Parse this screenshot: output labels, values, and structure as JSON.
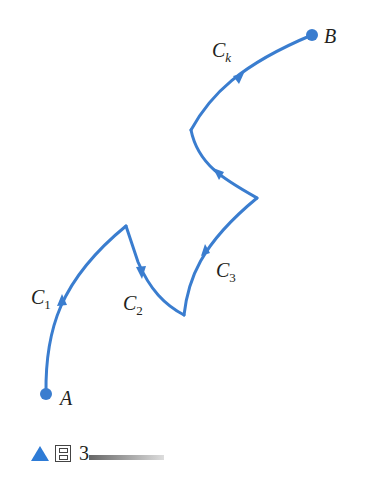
{
  "diagram": {
    "stroke_color": "#3a7dcf",
    "points": {
      "A": {
        "label": "A",
        "x": 46,
        "y": 394
      },
      "B": {
        "label": "B",
        "x": 312,
        "y": 35
      }
    },
    "curves": [
      {
        "name": "C1",
        "main": "C",
        "sub": "1"
      },
      {
        "name": "C2",
        "main": "C",
        "sub": "2"
      },
      {
        "name": "C3",
        "main": "C",
        "sub": "3"
      },
      {
        "name": "Ck",
        "main": "C",
        "sub": "k"
      }
    ]
  },
  "caption": {
    "glyph": "图",
    "number": "3"
  }
}
